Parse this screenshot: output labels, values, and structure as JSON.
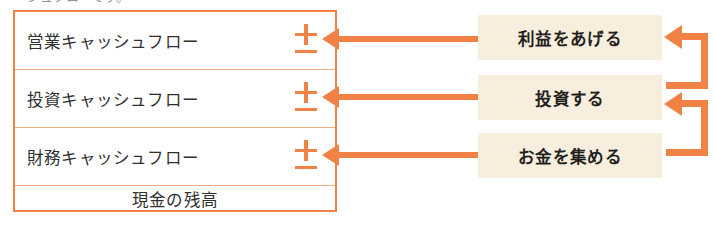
{
  "page": {
    "width": 714,
    "height": 236,
    "cropped_caption_above": "シュフローです。"
  },
  "colors": {
    "accent_orange": "#ef8244",
    "divider_orange": "#f2b183",
    "label_background": "#f7eedd",
    "text_dark": "#2f2f2f",
    "label_text": "#231f20",
    "page_background": "#ffffff"
  },
  "statement_table": {
    "name": "キャッシュフロー計算書",
    "rows": [
      {
        "label": "営業キャッシュフロー",
        "sign": "±",
        "centered": false
      },
      {
        "label": "投資キャッシュフロー",
        "sign": "±",
        "centered": false
      },
      {
        "label": "財務キャッシュフロー",
        "sign": "±",
        "centered": false
      },
      {
        "label": "現金の残高",
        "sign": "",
        "centered": true
      }
    ]
  },
  "actions": [
    {
      "label": "利益をあげる",
      "target_row": "営業キャッシュフロー"
    },
    {
      "label": "投資する",
      "target_row": "投資キャッシュフロー"
    },
    {
      "label": "お金を集める",
      "target_row": "財務キャッシュフロー"
    }
  ],
  "connectors": {
    "straight_arrows": [
      {
        "from": "利益をあげる",
        "to": "営業キャッシュフロー",
        "direction": "left"
      },
      {
        "from": "投資する",
        "to": "投資キャッシュフロー",
        "direction": "left"
      },
      {
        "from": "お金を集める",
        "to": "財務キャッシュフロー",
        "direction": "left"
      }
    ],
    "loop_arrows": [
      {
        "from": "投資する",
        "to": "利益をあげる",
        "shape": "hook-up-left"
      },
      {
        "from": "お金を集める",
        "to": "投資する",
        "shape": "hook-up-left"
      }
    ]
  },
  "icons": {
    "plus_minus": "plus-minus-icon",
    "arrow_left": "arrow-left-icon",
    "loop_arrow": "loop-arrow-icon"
  }
}
